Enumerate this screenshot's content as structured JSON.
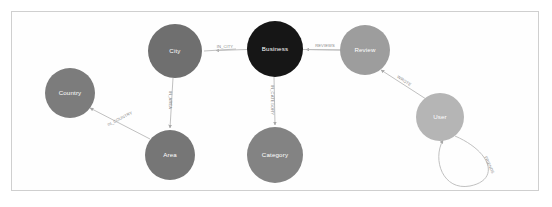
{
  "diagram": {
    "background_color": "#ffffff",
    "frame_border_color": "#cfcfcf",
    "edge_color": "#b9b9b9",
    "edge_label_color": "#8a8a8a",
    "node_label_color": "#ffffff"
  },
  "nodes": [
    {
      "id": "city",
      "label": "City",
      "cx": 175,
      "cy": 51,
      "r": 27,
      "color": "#6f6f6f"
    },
    {
      "id": "business",
      "label": "Business",
      "cx": 275,
      "cy": 49,
      "r": 28,
      "color": "#161616"
    },
    {
      "id": "review",
      "label": "Review",
      "cx": 365,
      "cy": 50,
      "r": 25,
      "color": "#9d9d9d"
    },
    {
      "id": "user",
      "label": "User",
      "cx": 440,
      "cy": 117,
      "r": 24,
      "color": "#b5b5b5"
    },
    {
      "id": "country",
      "label": "Country",
      "cx": 70,
      "cy": 93,
      "r": 25,
      "color": "#7c7c7c"
    },
    {
      "id": "area",
      "label": "Area",
      "cx": 170,
      "cy": 155,
      "r": 25,
      "color": "#767676"
    },
    {
      "id": "category",
      "label": "Category",
      "cx": 275,
      "cy": 155,
      "r": 28,
      "color": "#838383"
    }
  ],
  "edges": [
    {
      "id": "in_city",
      "label": "IN_CITY",
      "from": "business",
      "to": "city",
      "label_x": 225,
      "label_y": 47,
      "label_rotate": 0
    },
    {
      "id": "reviews",
      "label": "REVIEWS",
      "from": "review",
      "to": "business",
      "label_x": 325,
      "label_y": 46,
      "label_rotate": 0
    },
    {
      "id": "in_area",
      "label": "IN_AREA",
      "from": "city",
      "to": "area",
      "label_x": 170,
      "label_y": 100,
      "label_rotate": 90
    },
    {
      "id": "in_category",
      "label": "IN_CATEGORY",
      "from": "business",
      "to": "category",
      "label_x": 272,
      "label_y": 100,
      "label_rotate": 90
    },
    {
      "id": "in_country",
      "label": "IN_COUNTRY",
      "from": "area",
      "to": "country",
      "label_x": 120,
      "label_y": 122,
      "label_rotate": -34
    },
    {
      "id": "wrote",
      "label": "WROTE",
      "from": "user",
      "to": "review",
      "label_x": 405,
      "label_y": 83,
      "label_rotate": 56
    },
    {
      "id": "friends",
      "label": "FRIENDS",
      "from": "user",
      "to": "user",
      "label_x": 487,
      "label_y": 165,
      "label_rotate": 62
    }
  ]
}
